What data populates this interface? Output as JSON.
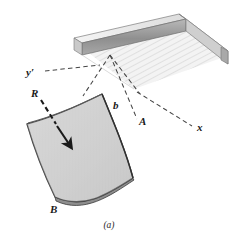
{
  "figure": {
    "caption": "(a)",
    "background_color": "#ffffff"
  },
  "labels": {
    "y_axis": "y′",
    "x_axis": "x",
    "resultant": "R",
    "width_b": "b",
    "point_a": "A",
    "point_b": "B"
  },
  "colors": {
    "surface_fill": "#d2d2d2",
    "surface_edge": "#3a3a3a",
    "tank_wall_face": "#9a9a9a",
    "tank_wall_top": "#e8e8e8",
    "tank_wall_side": "#c4c4c4",
    "liquid_surface": "#ededed",
    "hatch_line": "#cfcfcf",
    "dashed_line": "#4a4a4a",
    "arrow": "#1a1a1a",
    "text": "#1a1a1a"
  },
  "geometry": {
    "y_axis_line": {
      "x1": 44,
      "y1": 71,
      "x2": 101,
      "y2": 66
    },
    "x_axis_line": {
      "x1": 142,
      "y1": 95,
      "x2": 193,
      "y2": 126
    },
    "apex": {
      "x": 110,
      "y": 55
    },
    "resultant_arrow": {
      "tail_x": 46,
      "tail_y": 105,
      "head_x": 71,
      "head_y": 146,
      "leader_from_x": 40,
      "leader_from_y": 99
    },
    "curved_surface_points": "top-left(27,123) top-right(103,94) bottom-right(132,177) bottom-left(54,199)"
  },
  "elements": {
    "tank": "open-top rectangular reservoir drawn in isometric view",
    "liquid": "hatched free surface of liquid inside tank",
    "curved_plate": "curved submerged surface AB shown detached below the tank",
    "projection_lines": "dashed construction lines from tank corner to plate corners"
  }
}
